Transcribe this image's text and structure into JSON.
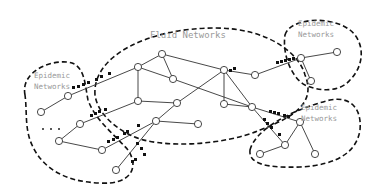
{
  "regions": [
    {
      "id": "fluid",
      "label": "Fluid Networks"
    },
    {
      "id": "epi-left",
      "label_lines": [
        "Epidemic",
        "Networks"
      ]
    },
    {
      "id": "epi-top-right",
      "label_lines": [
        "Epidemic",
        "Networks"
      ]
    },
    {
      "id": "epi-bottom-right",
      "label_lines": [
        "Epidemic",
        "Networks"
      ]
    }
  ],
  "nodes": [
    {
      "id": "n1",
      "x": 162,
      "y": 54
    },
    {
      "id": "n2",
      "x": 138,
      "y": 67
    },
    {
      "id": "n3",
      "x": 173,
      "y": 79
    },
    {
      "id": "n4",
      "x": 224,
      "y": 70
    },
    {
      "id": "n5",
      "x": 255,
      "y": 75
    },
    {
      "id": "n6",
      "x": 138,
      "y": 101
    },
    {
      "id": "n7",
      "x": 177,
      "y": 103
    },
    {
      "id": "n8",
      "x": 224,
      "y": 104
    },
    {
      "id": "n9",
      "x": 252,
      "y": 107
    },
    {
      "id": "n10",
      "x": 156,
      "y": 121
    },
    {
      "id": "n11",
      "x": 198,
      "y": 124
    },
    {
      "id": "n12",
      "x": 68,
      "y": 96
    },
    {
      "id": "n13",
      "x": 41,
      "y": 112
    },
    {
      "id": "n14",
      "x": 80,
      "y": 124
    },
    {
      "id": "n15",
      "x": 59,
      "y": 141
    },
    {
      "id": "n16",
      "x": 102,
      "y": 150
    },
    {
      "id": "n17",
      "x": 116,
      "y": 170
    },
    {
      "id": "n18",
      "x": 301,
      "y": 58
    },
    {
      "id": "n19",
      "x": 337,
      "y": 52
    },
    {
      "id": "n20",
      "x": 311,
      "y": 81
    },
    {
      "id": "n21",
      "x": 300,
      "y": 122
    },
    {
      "id": "n22",
      "x": 285,
      "y": 145
    },
    {
      "id": "n23",
      "x": 315,
      "y": 154
    },
    {
      "id": "n24",
      "x": 260,
      "y": 154
    }
  ],
  "edges": [
    [
      "n2",
      "n1"
    ],
    [
      "n1",
      "n3"
    ],
    [
      "n2",
      "n3"
    ],
    [
      "n1",
      "n4"
    ],
    [
      "n3",
      "n9"
    ],
    [
      "n4",
      "n5"
    ],
    [
      "n4",
      "n8"
    ],
    [
      "n4",
      "n9"
    ],
    [
      "n4",
      "n7"
    ],
    [
      "n2",
      "n6"
    ],
    [
      "n6",
      "n7"
    ],
    [
      "n7",
      "n10"
    ],
    [
      "n8",
      "n9"
    ],
    [
      "n12",
      "n2"
    ],
    [
      "n13",
      "n12"
    ],
    [
      "n14",
      "n6"
    ],
    [
      "n15",
      "n14"
    ],
    [
      "n15",
      "n16"
    ],
    [
      "n16",
      "n10"
    ],
    [
      "n10",
      "n11"
    ],
    [
      "n10",
      "n17"
    ],
    [
      "n5",
      "n18"
    ],
    [
      "n18",
      "n19"
    ],
    [
      "n18",
      "n20"
    ],
    [
      "n9",
      "n21"
    ],
    [
      "n9",
      "n22"
    ],
    [
      "n21",
      "n22"
    ],
    [
      "n21",
      "n23"
    ],
    [
      "n22",
      "n24"
    ]
  ],
  "ellipsis": "..."
}
